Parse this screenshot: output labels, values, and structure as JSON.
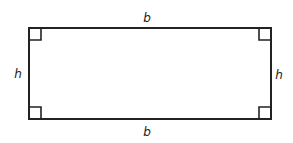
{
  "diagram": {
    "type": "rectangle",
    "labels": {
      "top": "b",
      "bottom": "b",
      "left": "h",
      "right": "h"
    },
    "right_angle_markers": 4,
    "colors": {
      "stroke": "#222222",
      "background": "#ffffff"
    }
  }
}
